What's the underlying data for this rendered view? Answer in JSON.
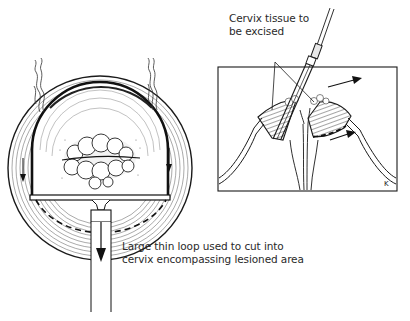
{
  "figure": {
    "left_panel": "Frontal view of cervix with loop electrode sweeping across lesion",
    "right_panel": "Cross-section view of cervix with loop excising tissue",
    "colors": {
      "ink": "#1a1a1a",
      "background": "#ffffff",
      "text": "#2a2a2a"
    }
  },
  "labels": {
    "tissue": {
      "line1": "Cervix tissue to",
      "line2": "be excised"
    },
    "loop": {
      "line1": "Large thin loop used to cut into",
      "line2": "cervix encompassing lesioned area"
    },
    "signature": "K"
  },
  "icons": {
    "smoke_plumes": "smoke-icon",
    "motion_arrows": "arrow-icon"
  }
}
